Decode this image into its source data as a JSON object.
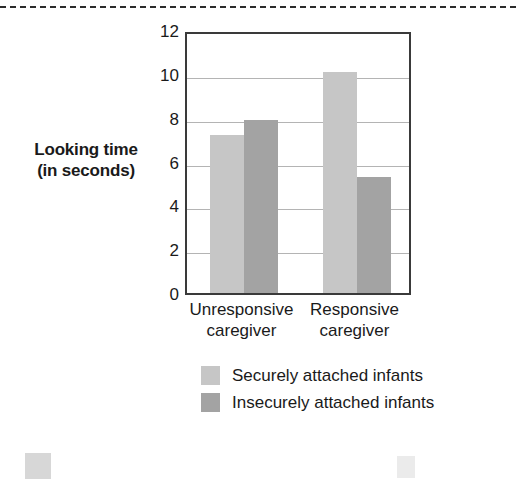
{
  "chart_data": {
    "type": "bar",
    "title": "",
    "xlabel": "",
    "ylabel": "Looking time (in seconds)",
    "ylabel_line1": "Looking time",
    "ylabel_line2": "(in seconds)",
    "categories": [
      "Unresponsive caregiver",
      "Responsive caregiver"
    ],
    "category_lines": [
      [
        "Unresponsive",
        "caregiver"
      ],
      [
        "Responsive",
        "caregiver"
      ]
    ],
    "series": [
      {
        "name": "Securely attached infants",
        "values": [
          7.2,
          10.1
        ],
        "color": "#c6c6c6"
      },
      {
        "name": "Insecurely attached infants",
        "values": [
          7.9,
          5.3
        ],
        "color": "#a3a3a3"
      }
    ],
    "ylim": [
      0,
      12
    ],
    "ytick_values": [
      0,
      2,
      4,
      6,
      8,
      10,
      12
    ],
    "ytick_labels": [
      "0",
      "2",
      "4",
      "6",
      "8",
      "10",
      "12"
    ],
    "grid": true,
    "grid_axis": "y",
    "legend_position": "below-plot"
  },
  "legend": {
    "items": [
      {
        "label": "Securely attached infants",
        "swatch": "secure"
      },
      {
        "label": "Insecurely attached infants",
        "swatch": "insecure"
      }
    ]
  },
  "colors": {
    "secure_bar": "#c6c6c6",
    "insecure_bar": "#a3a3a3",
    "axis_line": "#3a3a3a",
    "gridline": "#b4b4b4",
    "text": "#1a1a1a",
    "page_background": "#ffffff",
    "cut_rule": "#2b2b2b"
  }
}
